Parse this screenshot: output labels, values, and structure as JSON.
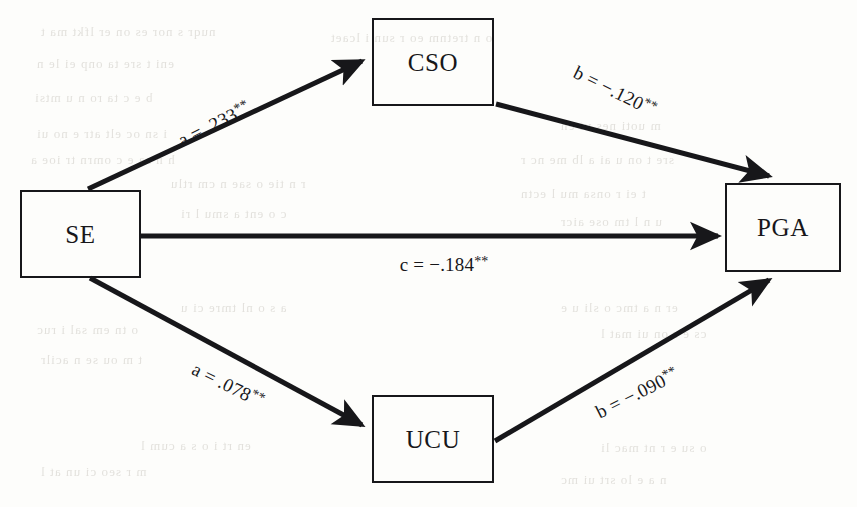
{
  "figure": {
    "kind": "mediation-path-diagram",
    "background_color": "#fdfdfb",
    "ink_color": "#17171a",
    "ghost_text_color": "#c9c6bf"
  },
  "nodes": [
    {
      "id": "se",
      "label": "SE",
      "x": 20,
      "y": 190,
      "w": 121,
      "h": 88
    },
    {
      "id": "cso",
      "label": "CSO",
      "x": 372,
      "y": 18,
      "w": 122,
      "h": 88
    },
    {
      "id": "ucu",
      "label": "UCU",
      "x": 372,
      "y": 395,
      "w": 122,
      "h": 88
    },
    {
      "id": "pga",
      "label": "PGA",
      "x": 725,
      "y": 183,
      "w": 116,
      "h": 89
    }
  ],
  "paths": [
    {
      "id": "a-se-cso",
      "from": "se",
      "to": "cso",
      "coefficient_name": "a",
      "value": ".233",
      "sign": "",
      "significance": "**",
      "label": "a = .233**",
      "label_x": 214,
      "label_y": 124,
      "label_rotation": -26.5
    },
    {
      "id": "b-cso-pga",
      "from": "cso",
      "to": "pga",
      "coefficient_name": "b",
      "value": ".120",
      "sign": "−",
      "significance": "**",
      "label": "b = −.120**",
      "label_x": 615,
      "label_y": 91,
      "label_rotation": 26.5
    },
    {
      "id": "c-se-pga",
      "from": "se",
      "to": "pga",
      "coefficient_name": "c",
      "value": ".184",
      "sign": "−",
      "significance": "**",
      "label": "c = −.184**",
      "label_x": 444,
      "label_y": 265,
      "label_rotation": 0
    },
    {
      "id": "a-se-ucu",
      "from": "se",
      "to": "ucu",
      "coefficient_name": "a",
      "value": ".078",
      "sign": "",
      "significance": "**",
      "label": "a = .078**",
      "label_x": 228,
      "label_y": 385,
      "label_rotation": 26.5
    },
    {
      "id": "b-ucu-pga",
      "from": "ucu",
      "to": "pga",
      "coefficient_name": "b",
      "value": ".090",
      "sign": "−",
      "significance": "**",
      "label": "b = −.090**",
      "label_x": 637,
      "label_y": 393,
      "label_rotation": -26.5
    }
  ],
  "ghost_text": [
    {
      "text": "nuqr s nor es on er lfkt ma t",
      "x": 40,
      "y": 24,
      "size": 13
    },
    {
      "text": "o n tretnm eo r sun i lcaet",
      "x": 330,
      "y": 30,
      "size": 13
    },
    {
      "text": "eni t sre ta onp ei le n",
      "x": 36,
      "y": 56,
      "size": 13
    },
    {
      "text": "b e c ta ro n u mtsi",
      "x": 34,
      "y": 90,
      "size": 13
    },
    {
      "text": "i sn oc elt atr e no ui",
      "x": 36,
      "y": 126,
      "size": 13
    },
    {
      "text": "m uoti nes vt en",
      "x": 560,
      "y": 118,
      "size": 13
    },
    {
      "text": "h n sa e c omrn tr ioe a",
      "x": 30,
      "y": 152,
      "size": 13
    },
    {
      "text": "sre t on u ai a lb me nc r",
      "x": 520,
      "y": 152,
      "size": 13
    },
    {
      "text": "r n tie o sae n cm rtlu",
      "x": 170,
      "y": 176,
      "size": 13
    },
    {
      "text": "t ei r onsa mu l ectn",
      "x": 520,
      "y": 186,
      "size": 13
    },
    {
      "text": "c o ent a smu l ri",
      "x": 180,
      "y": 206,
      "size": 13
    },
    {
      "text": "u n l tm ose aicr",
      "x": 560,
      "y": 214,
      "size": 13
    },
    {
      "text": "a s o nl tmre ci u",
      "x": 180,
      "y": 300,
      "size": 13
    },
    {
      "text": "er n a tmc o sli u e",
      "x": 560,
      "y": 300,
      "size": 13
    },
    {
      "text": "o tn em sal i ruc",
      "x": 36,
      "y": 322,
      "size": 13
    },
    {
      "text": "cs e r on ui mat l",
      "x": 600,
      "y": 326,
      "size": 13
    },
    {
      "text": "t m ou se n acilr",
      "x": 40,
      "y": 352,
      "size": 13
    },
    {
      "text": "en rt i o s a cum l",
      "x": 140,
      "y": 438,
      "size": 13
    },
    {
      "text": "o su e r nt mac li",
      "x": 600,
      "y": 440,
      "size": 13
    },
    {
      "text": "m r seo ci un at l",
      "x": 40,
      "y": 464,
      "size": 13
    },
    {
      "text": "n a e lo srt ui mc",
      "x": 560,
      "y": 472,
      "size": 13
    }
  ]
}
